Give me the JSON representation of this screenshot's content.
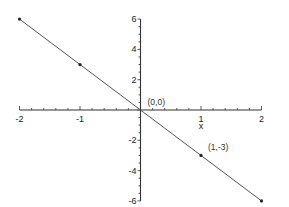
{
  "chart_data": {
    "type": "line",
    "title": "",
    "xlabel": "x",
    "ylabel": "",
    "xlim": [
      -2,
      2
    ],
    "ylim": [
      -6,
      6
    ],
    "grid": false,
    "legend": null,
    "x_ticks": [
      -2,
      -1,
      1,
      2
    ],
    "x_tick_labels": [
      "-2",
      "-1",
      "1",
      "2"
    ],
    "y_ticks": [
      6,
      4,
      2,
      -2,
      -4,
      -6
    ],
    "y_tick_labels": [
      "6",
      "4",
      "2",
      "-2",
      "-4",
      "-6"
    ],
    "series": [
      {
        "name": "y = -3x",
        "x": [
          -2,
          -1,
          0,
          1,
          2
        ],
        "y": [
          6,
          3,
          0,
          -3,
          -6
        ],
        "color": "#555555"
      }
    ],
    "markers": [
      {
        "x": -2,
        "y": 6
      },
      {
        "x": -1,
        "y": 3
      },
      {
        "x": 0,
        "y": 0
      },
      {
        "x": 1,
        "y": -3
      },
      {
        "x": 2,
        "y": -6
      }
    ],
    "annotations": [
      {
        "text": "(0,0)",
        "x": 0,
        "y": 0
      },
      {
        "text": "(1,-3)",
        "x": 1,
        "y": -3
      }
    ]
  },
  "colors": {
    "axis": "#333333",
    "line": "#555555",
    "text": "#222222"
  }
}
